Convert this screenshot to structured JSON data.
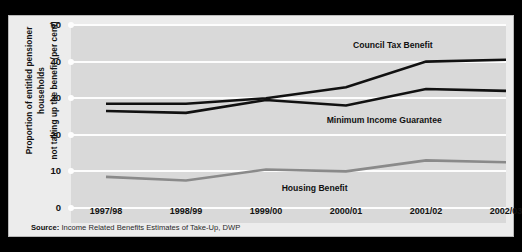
{
  "figure": {
    "yaxis_title_line1": "Proportion of entitled pensioner households",
    "yaxis_title_line2": "not taking up the benefit (per cent)",
    "source_prefix": "Source:",
    "source_text": "Income Related Benefits Estimates of Take-Up, DWP"
  },
  "colors": {
    "frame": "#000000",
    "panel": "#ececec",
    "plot_background": "#d9d9d9",
    "gridline": "#fdfdfd",
    "council_tax_benefit": "#111111",
    "minimum_income_guarantee": "#111111",
    "housing_benefit": "#8a8a8a",
    "text": "#111111"
  },
  "chart_data": {
    "type": "line",
    "title": "",
    "xlabel": "",
    "ylabel": "Proportion of entitled pensioner households not taking up the benefit (per cent)",
    "categories": [
      "1997/98",
      "1998/99",
      "1999/00",
      "2000/01",
      "2001/02",
      "2002/03"
    ],
    "ylim": [
      0,
      50
    ],
    "yticks": [
      0,
      10,
      20,
      30,
      40,
      50
    ],
    "grid": true,
    "legend": "inline-labels",
    "series": [
      {
        "name": "Council Tax Benefit",
        "color": "#111111",
        "values": [
          28.5,
          28.5,
          30,
          33,
          40,
          40.5
        ]
      },
      {
        "name": "Minimum Income Guarantee",
        "color": "#111111",
        "values": [
          26.5,
          26,
          29.5,
          28,
          32.5,
          32
        ]
      },
      {
        "name": "Housing Benefit",
        "color": "#8a8a8a",
        "values": [
          8.5,
          7.5,
          10.5,
          10,
          13,
          12.5
        ]
      }
    ],
    "annotations": [
      {
        "text": "Council Tax Benefit",
        "x_frac": 0.74,
        "value": 44.5
      },
      {
        "text": "Minimum Income Guarantee",
        "x_frac": 0.72,
        "value": 24.0
      },
      {
        "text": "Housing Benefit",
        "x_frac": 0.56,
        "value": 5.5
      }
    ]
  }
}
